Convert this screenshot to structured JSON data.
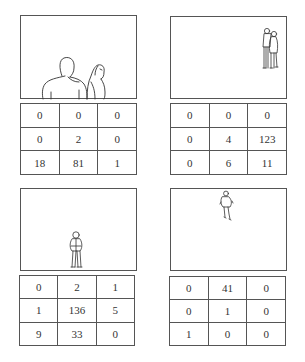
{
  "panels": [
    {
      "id": "panel-1",
      "scene": "two people in foreground at bottom of frame (close-up, large)",
      "grid": [
        [
          "0",
          "0",
          "0"
        ],
        [
          "0",
          "2",
          "0"
        ],
        [
          "18",
          "81",
          "1"
        ]
      ]
    },
    {
      "id": "panel-2",
      "scene": "two people standing in upper-right of frame (small)",
      "grid": [
        [
          "0",
          "0",
          "0"
        ],
        [
          "0",
          "4",
          "123"
        ],
        [
          "0",
          "6",
          "11"
        ]
      ]
    },
    {
      "id": "panel-3",
      "scene": "single person standing at center-bottom of frame",
      "grid": [
        [
          "0",
          "2",
          "1"
        ],
        [
          "1",
          "136",
          "5"
        ],
        [
          "9",
          "33",
          "0"
        ]
      ]
    },
    {
      "id": "panel-4",
      "scene": "single person walking at top-center of frame",
      "grid": [
        [
          "0",
          "41",
          "0"
        ],
        [
          "0",
          "1",
          "0"
        ],
        [
          "1",
          "0",
          "0"
        ]
      ]
    }
  ]
}
